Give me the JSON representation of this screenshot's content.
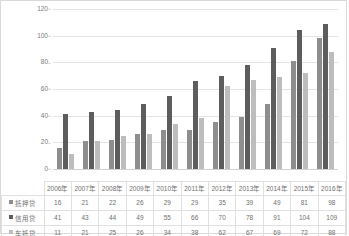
{
  "chart_data": {
    "type": "bar",
    "title": "",
    "xlabel": "",
    "ylabel": "",
    "ylim": [
      0,
      120
    ],
    "yticks": [
      0,
      20,
      40,
      60,
      80,
      100,
      120
    ],
    "grid": true,
    "legend_position": "table-left",
    "categories": [
      "2006年",
      "2007年",
      "2008年",
      "2009年",
      "2010年",
      "2011年",
      "2012年",
      "2013年",
      "2014年",
      "2015年",
      "2016年"
    ],
    "series": [
      {
        "name": "抵押贷",
        "color": "#8e8e8e",
        "values": [
          16,
          21,
          22,
          26,
          29,
          29,
          35,
          39,
          49,
          81,
          98
        ]
      },
      {
        "name": "信用贷",
        "color": "#5d5d5d",
        "values": [
          41,
          43,
          44,
          49,
          55,
          66,
          70,
          78,
          91,
          104,
          109
        ]
      },
      {
        "name": "车抵贷",
        "color": "#bdbdbd",
        "values": [
          11,
          21,
          25,
          26,
          34,
          38,
          62,
          67,
          69,
          72,
          88
        ]
      }
    ]
  },
  "colors": {
    "series_1": "#8e8e8e",
    "series_2": "#5d5d5d",
    "series_3": "#bdbdbd",
    "gridline": "#e4e4e4",
    "border": "#d9d9d9",
    "text": "#6f6f6f"
  }
}
